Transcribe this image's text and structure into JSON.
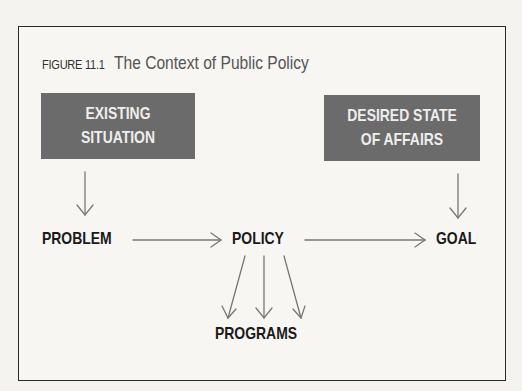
{
  "figure": {
    "number": "FIGURE 11.1",
    "title": "The Context of Public Policy"
  },
  "boxes": {
    "existing": {
      "line1": "EXISTING",
      "line2": "SITUATION"
    },
    "desired": {
      "line1": "DESIRED STATE",
      "line2": "OF AFFAIRS"
    }
  },
  "nodes": {
    "problem": "PROBLEM",
    "policy": "POLICY",
    "goal": "GOAL",
    "programs": "PROGRAMS"
  },
  "colors": {
    "box_fill": "#6b6b6b",
    "box_text": "#eeeeee",
    "arrow": "#777777",
    "frame": "#2a2a2a"
  }
}
